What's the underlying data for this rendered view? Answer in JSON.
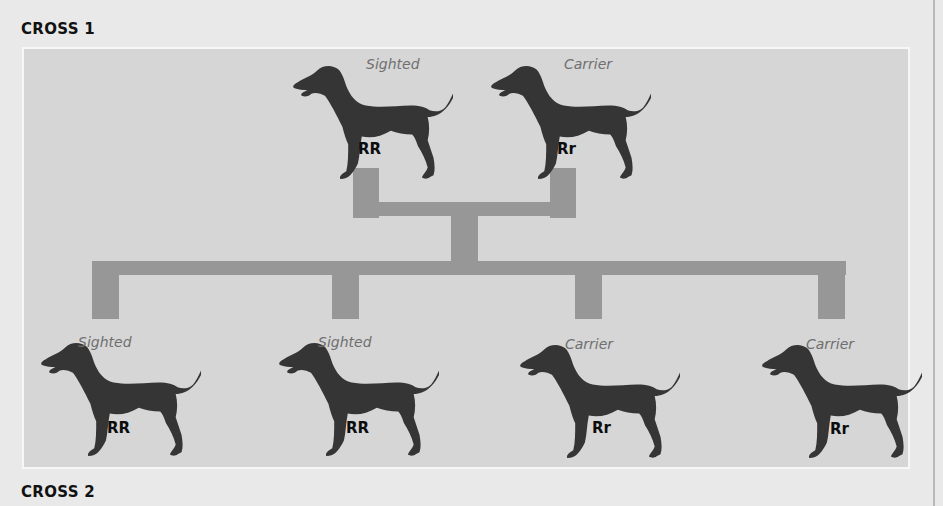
{
  "headings": {
    "cross1": "CROSS 1",
    "cross2": "CROSS 2"
  },
  "colors": {
    "panel_bg": "#d6d6d6",
    "connector": "#979797",
    "dog": "#353535",
    "phenotype_text": "#6f6f6f"
  },
  "parents": [
    {
      "phenotype": "Sighted",
      "genotype": "RR",
      "icon": "dog-silhouette-icon"
    },
    {
      "phenotype": "Carrier",
      "genotype": "Rr",
      "icon": "dog-silhouette-icon"
    }
  ],
  "offspring": [
    {
      "phenotype": "Sighted",
      "genotype": "RR",
      "icon": "dog-silhouette-icon"
    },
    {
      "phenotype": "Sighted",
      "genotype": "RR",
      "icon": "dog-silhouette-icon"
    },
    {
      "phenotype": "Carrier",
      "genotype": "Rr",
      "icon": "dog-silhouette-icon"
    },
    {
      "phenotype": "Carrier",
      "genotype": "Rr",
      "icon": "dog-silhouette-icon"
    }
  ]
}
